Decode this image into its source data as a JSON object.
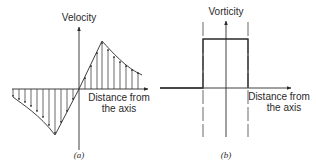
{
  "figure": {
    "panel_a": {
      "y_axis_label": "Velocity",
      "x_axis_label_line1": "Distance from",
      "x_axis_label_line2": "the axis",
      "caption": "(a)"
    },
    "panel_b": {
      "y_axis_label": "Vorticity",
      "x_axis_label_line1": "Distance from",
      "x_axis_label_line2": "the axis",
      "caption": "(b)"
    },
    "colors": {
      "line": "#2a2a2a",
      "background": "#ffffff"
    }
  }
}
